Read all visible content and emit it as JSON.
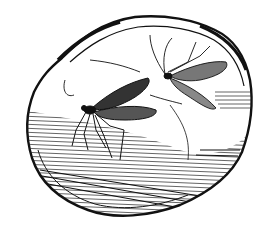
{
  "image": {
    "subject": "engraving of two winged insects preserved in a piece of amber",
    "style": "black-and-white line engraving",
    "colors": {
      "ink": "#111111",
      "background": "#ffffff"
    }
  }
}
